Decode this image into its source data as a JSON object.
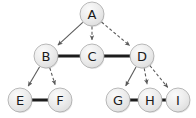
{
  "diagram": {
    "width": 196,
    "height": 118,
    "background_color": "#ffffff",
    "node_fill_color": "#e8e8e8",
    "node_border_color": "#a8a8a8",
    "node_label_color": "#1a1a1a",
    "tree_edge_color": "#5a5a5a",
    "sibling_edge_color": "#1c1c1c",
    "node_radius": 12,
    "nodes": [
      {
        "id": "A",
        "label": "A",
        "cx": 92,
        "cy": 14
      },
      {
        "id": "B",
        "label": "B",
        "cx": 46,
        "cy": 56
      },
      {
        "id": "C",
        "label": "C",
        "cx": 92,
        "cy": 56
      },
      {
        "id": "D",
        "label": "D",
        "cx": 142,
        "cy": 56
      },
      {
        "id": "E",
        "label": "E",
        "cx": 20,
        "cy": 100
      },
      {
        "id": "F",
        "label": "F",
        "cx": 60,
        "cy": 100
      },
      {
        "id": "G",
        "label": "G",
        "cx": 118,
        "cy": 100
      },
      {
        "id": "H",
        "label": "H",
        "cx": 150,
        "cy": 100
      },
      {
        "id": "I",
        "label": "I",
        "cx": 178,
        "cy": 100
      }
    ],
    "tree_edges": [
      {
        "from": "A",
        "to": "B",
        "style": "solid",
        "arrow": true
      },
      {
        "from": "A",
        "to": "C",
        "style": "dashed",
        "arrow": true
      },
      {
        "from": "A",
        "to": "D",
        "style": "dashed",
        "arrow": true
      },
      {
        "from": "B",
        "to": "E",
        "style": "solid",
        "arrow": true
      },
      {
        "from": "B",
        "to": "F",
        "style": "dashed",
        "arrow": true
      },
      {
        "from": "D",
        "to": "G",
        "style": "solid",
        "arrow": true
      },
      {
        "from": "D",
        "to": "H",
        "style": "dashed",
        "arrow": true
      },
      {
        "from": "D",
        "to": "I",
        "style": "dashed",
        "arrow": true
      }
    ],
    "sibling_edges": [
      {
        "from": "B",
        "to": "C"
      },
      {
        "from": "C",
        "to": "D"
      },
      {
        "from": "E",
        "to": "F"
      },
      {
        "from": "G",
        "to": "H"
      },
      {
        "from": "H",
        "to": "I"
      }
    ]
  }
}
